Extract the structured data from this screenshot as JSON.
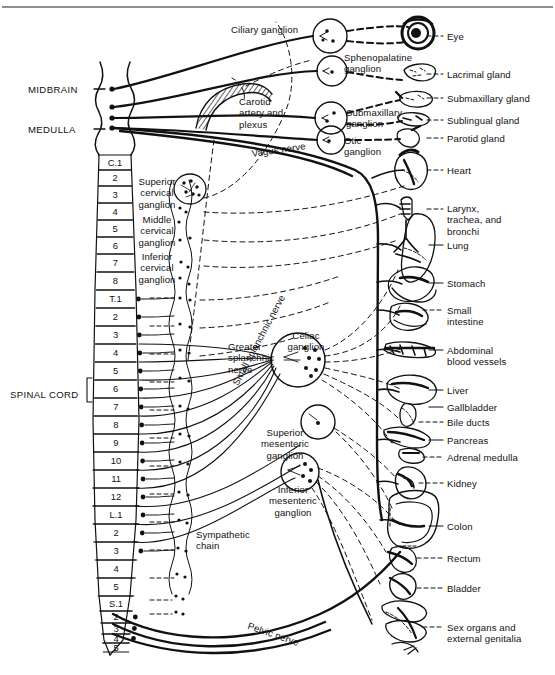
{
  "figure": {
    "domain_title": "Autonomic nervous system innervation diagram",
    "top_rule": true,
    "caption_faint": ""
  },
  "cns_labels": [
    {
      "id": "midbrain",
      "text": "MIDBRAIN",
      "x": 28,
      "y": 84
    },
    {
      "id": "medulla",
      "text": "MEDULLA",
      "x": 28,
      "y": 124
    },
    {
      "id": "spinal-cord",
      "text": "SPINAL CORD",
      "x": 10,
      "y": 389
    }
  ],
  "spinal_segments": [
    {
      "label": "C.1",
      "y": 155,
      "h": 15,
      "dot": false
    },
    {
      "label": "2",
      "y": 170,
      "h": 16,
      "dot": false
    },
    {
      "label": "3",
      "y": 186,
      "h": 17,
      "dot": false
    },
    {
      "label": "4",
      "y": 203,
      "h": 17,
      "dot": false
    },
    {
      "label": "5",
      "y": 220,
      "h": 17,
      "dot": false
    },
    {
      "label": "6",
      "y": 237,
      "h": 17,
      "dot": false
    },
    {
      "label": "7",
      "y": 254,
      "h": 18,
      "dot": false
    },
    {
      "label": "8",
      "y": 272,
      "h": 18,
      "dot": false
    },
    {
      "label": "T.1",
      "y": 290,
      "h": 18,
      "dot": true
    },
    {
      "label": "2",
      "y": 308,
      "h": 18,
      "dot": true
    },
    {
      "label": "3",
      "y": 326,
      "h": 18,
      "dot": true
    },
    {
      "label": "4",
      "y": 344,
      "h": 18,
      "dot": true
    },
    {
      "label": "5",
      "y": 362,
      "h": 18,
      "dot": true
    },
    {
      "label": "6",
      "y": 380,
      "h": 18,
      "dot": true
    },
    {
      "label": "7",
      "y": 398,
      "h": 18,
      "dot": true
    },
    {
      "label": "8",
      "y": 416,
      "h": 18,
      "dot": true
    },
    {
      "label": "9",
      "y": 434,
      "h": 18,
      "dot": true
    },
    {
      "label": "10",
      "y": 452,
      "h": 18,
      "dot": true
    },
    {
      "label": "11",
      "y": 470,
      "h": 18,
      "dot": true
    },
    {
      "label": "12",
      "y": 488,
      "h": 18,
      "dot": true
    },
    {
      "label": "L.1",
      "y": 506,
      "h": 18,
      "dot": true
    },
    {
      "label": "2",
      "y": 524,
      "h": 18,
      "dot": true
    },
    {
      "label": "3",
      "y": 542,
      "h": 18,
      "dot": true
    },
    {
      "label": "4",
      "y": 560,
      "h": 18,
      "dot": false
    },
    {
      "label": "5",
      "y": 578,
      "h": 18,
      "dot": false
    },
    {
      "label": "S.1",
      "y": 596,
      "h": 15,
      "dot": false
    },
    {
      "label": "2",
      "y": 611,
      "h": 12,
      "dot": true
    },
    {
      "label": "3",
      "y": 623,
      "h": 11,
      "dot": true
    },
    {
      "label": "4",
      "y": 634,
      "h": 9,
      "dot": true
    },
    {
      "label": "5",
      "y": 643,
      "h": 9,
      "dot": false
    }
  ],
  "ganglia": [
    {
      "id": "ciliary",
      "text": "Ciliary ganglion",
      "x": 231,
      "y": 24,
      "w": 96,
      "align": "left",
      "cx": 330,
      "cy": 36,
      "r": 17
    },
    {
      "id": "sphenopalatine",
      "text": "Sphenopalatine\nganglion",
      "x": 344,
      "y": 52,
      "w": 86,
      "align": "left",
      "cx": 332,
      "cy": 71,
      "r": 15
    },
    {
      "id": "submaxillary",
      "text": "Submaxillary\nganglion",
      "x": 346,
      "y": 107,
      "w": 80,
      "align": "left",
      "cx": 331,
      "cy": 118,
      "r": 16
    },
    {
      "id": "otic",
      "text": "Otic\nganglion",
      "x": 344,
      "y": 135,
      "w": 48,
      "align": "left",
      "cx": 331,
      "cy": 140,
      "r": 14
    },
    {
      "id": "superior-cervical",
      "text": "Superior\ncervical\nganglion",
      "x": 126,
      "y": 176,
      "w": 62,
      "align": "center",
      "cx": 0,
      "cy": 0,
      "r": 0
    },
    {
      "id": "middle-cervical",
      "text": "Middle\ncervical\nganglion",
      "x": 126,
      "y": 214,
      "w": 62,
      "align": "center",
      "cx": 0,
      "cy": 0,
      "r": 0
    },
    {
      "id": "inferior-cervical",
      "text": "Inferior\ncervical\nganglion",
      "x": 126,
      "y": 251,
      "w": 62,
      "align": "center",
      "cx": 0,
      "cy": 0,
      "r": 0
    },
    {
      "id": "celiac",
      "text": "Celiac\nganglion",
      "x": 275,
      "y": 330,
      "w": 62,
      "align": "center",
      "cx": 298,
      "cy": 360,
      "r": 27
    },
    {
      "id": "superior-mesenteric",
      "text": "Superior\nmesenteric\nganglion",
      "x": 248,
      "y": 427,
      "w": 74,
      "align": "center",
      "cx": 318,
      "cy": 422,
      "r": 17
    },
    {
      "id": "inferior-mesenteric",
      "text": "Inferior\nmesenteric\nganglion",
      "x": 258,
      "y": 484,
      "w": 70,
      "align": "center",
      "cx": 300,
      "cy": 472,
      "r": 19
    }
  ],
  "nerve_labels": [
    {
      "id": "carotid-artery-plexus",
      "text": "Carotid\nartery and\nplexus",
      "x": 239,
      "y": 96,
      "rotate": 0
    },
    {
      "id": "vagus-nerve",
      "text": "Vagus nerve",
      "x": 251,
      "y": 148,
      "rotate": -8
    },
    {
      "id": "greater-splanchnic",
      "text": "Greater\nsplanchnic\nnerve",
      "x": 228,
      "y": 341,
      "rotate": 0
    },
    {
      "id": "small-splanchnic-nerve",
      "text": "Small splanchnic nerve",
      "x": 230,
      "y": 382,
      "rotate": -62
    },
    {
      "id": "sympathetic-chain",
      "text": "Sympathetic\nchain",
      "x": 196,
      "y": 529,
      "rotate": 0
    },
    {
      "id": "pelvic-nerve",
      "text": "Pelvic nerve",
      "x": 250,
      "y": 620,
      "rotate": 19
    }
  ],
  "organs": [
    {
      "id": "eye",
      "text": "Eye",
      "lx": 447,
      "ly": 31,
      "leader": "dash",
      "ly_line": 36,
      "x1": 427,
      "x2": 443
    },
    {
      "id": "lacrimal-gland",
      "text": "Lacrimal gland",
      "lx": 447,
      "ly": 69,
      "leader": "dash",
      "ly_line": 74,
      "x1": 427,
      "x2": 443
    },
    {
      "id": "submaxillary-gland",
      "text": "Submaxillary gland",
      "lx": 447,
      "ly": 93,
      "leader": "dash",
      "ly_line": 98,
      "x1": 427,
      "x2": 443
    },
    {
      "id": "sublingual-gland",
      "text": "Sublingual gland",
      "lx": 447,
      "ly": 115,
      "leader": "dash",
      "ly_line": 120,
      "x1": 427,
      "x2": 443
    },
    {
      "id": "parotid-gland",
      "text": "Parotid gland",
      "lx": 447,
      "ly": 133,
      "leader": "dash",
      "ly_line": 138,
      "x1": 427,
      "x2": 443
    },
    {
      "id": "heart",
      "text": "Heart",
      "lx": 447,
      "ly": 165,
      "leader": "dash",
      "ly_line": 170,
      "x1": 427,
      "x2": 443
    },
    {
      "id": "larynx-trachea",
      "text": "Larynx,\ntrachea, and\nbronchi",
      "lx": 447,
      "ly": 203,
      "leader": "dash",
      "ly_line": 209,
      "x1": 427,
      "x2": 443
    },
    {
      "id": "lung",
      "text": "Lung",
      "lx": 447,
      "ly": 240,
      "leader": "solid",
      "ly_line": 245,
      "x1": 429,
      "x2": 443
    },
    {
      "id": "stomach",
      "text": "Stomach",
      "lx": 447,
      "ly": 278,
      "leader": "solid",
      "ly_line": 283,
      "x1": 429,
      "x2": 443
    },
    {
      "id": "small-intestine",
      "text": "Small\nintestine",
      "lx": 447,
      "ly": 305,
      "leader": "dash",
      "ly_line": 310,
      "x1": 423,
      "x2": 443
    },
    {
      "id": "abdominal-vessels",
      "text": "Abdominal\nblood vessels",
      "lx": 447,
      "ly": 345,
      "leader": "solid",
      "ly_line": 350,
      "x1": 429,
      "x2": 443
    },
    {
      "id": "liver",
      "text": "Liver",
      "lx": 447,
      "ly": 385,
      "leader": "solid",
      "ly_line": 390,
      "x1": 429,
      "x2": 443
    },
    {
      "id": "gallbladder",
      "text": "Gallbladder",
      "lx": 447,
      "ly": 402,
      "leader": "solid",
      "ly_line": 407,
      "x1": 429,
      "x2": 443
    },
    {
      "id": "bile-ducts",
      "text": "Bile ducts",
      "lx": 447,
      "ly": 417,
      "leader": "dash",
      "ly_line": 422,
      "x1": 419,
      "x2": 443
    },
    {
      "id": "pancreas",
      "text": "Pancreas",
      "lx": 447,
      "ly": 435,
      "leader": "solid",
      "ly_line": 440,
      "x1": 429,
      "x2": 443
    },
    {
      "id": "adrenal-medulla",
      "text": "Adrenal medulla",
      "lx": 447,
      "ly": 452,
      "leader": "dash",
      "ly_line": 457,
      "x1": 423,
      "x2": 443
    },
    {
      "id": "kidney",
      "text": "Kidney",
      "lx": 447,
      "ly": 478,
      "leader": "dash",
      "ly_line": 483,
      "x1": 419,
      "x2": 443
    },
    {
      "id": "colon",
      "text": "Colon",
      "lx": 447,
      "ly": 521,
      "leader": "solid",
      "ly_line": 526,
      "x1": 429,
      "x2": 443
    },
    {
      "id": "rectum",
      "text": "Rectum",
      "lx": 447,
      "ly": 553,
      "leader": "dash",
      "ly_line": 558,
      "x1": 417,
      "x2": 443
    },
    {
      "id": "bladder",
      "text": "Bladder",
      "lx": 447,
      "ly": 583,
      "leader": "dash",
      "ly_line": 588,
      "x1": 417,
      "x2": 443
    },
    {
      "id": "sex-organs",
      "text": "Sex organs and\nexternal genitalia",
      "lx": 447,
      "ly": 622,
      "leader": "dash",
      "ly_line": 627,
      "x1": 423,
      "x2": 443
    }
  ],
  "colors": {
    "ink": "#111111",
    "rule": "#8e8e8e",
    "paper": "#ffffff"
  }
}
